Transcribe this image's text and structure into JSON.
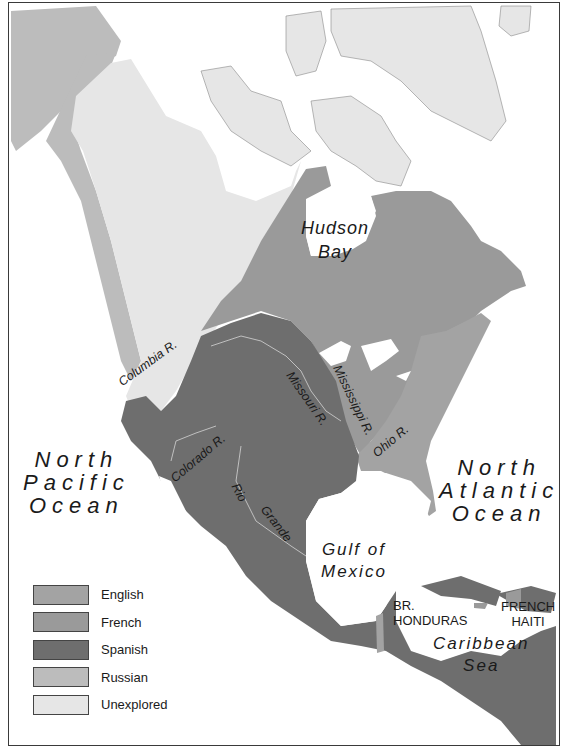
{
  "map": {
    "title": "",
    "colors": {
      "english": "#a3a3a3",
      "french": "#9a9a9a",
      "spanish": "#6e6e6e",
      "russian": "#bcbcbc",
      "unexplored": "#e6e6e6",
      "water": "#ffffff",
      "border": "#3a3a3a"
    },
    "labels": {
      "hudson_bay": [
        "Hudson",
        "Bay"
      ],
      "north_pacific": [
        "North",
        "Pacific",
        "Ocean"
      ],
      "north_atlantic": [
        "North",
        "Atlantic",
        "Ocean"
      ],
      "gulf_of_mexico": [
        "Gulf of",
        "Mexico"
      ],
      "caribbean_sea": [
        "Caribbean",
        "Sea"
      ],
      "br_honduras": [
        "BR.",
        "HONDURAS"
      ],
      "french_haiti": [
        "FRENCH",
        "HAITI"
      ]
    },
    "rivers": {
      "columbia": "Columbia R.",
      "missouri": "Missouri R.",
      "mississippi": "Mississippi R.",
      "ohio": "Ohio R.",
      "colorado": "Colorado R.",
      "rio_grande_1": "Rio",
      "rio_grande_2": "Grande"
    },
    "legend": [
      {
        "label": "English",
        "color": "#a3a3a3"
      },
      {
        "label": "French",
        "color": "#9a9a9a"
      },
      {
        "label": "Spanish",
        "color": "#6e6e6e"
      },
      {
        "label": "Russian",
        "color": "#bcbcbc"
      },
      {
        "label": "Unexplored",
        "color": "#e6e6e6"
      }
    ]
  }
}
